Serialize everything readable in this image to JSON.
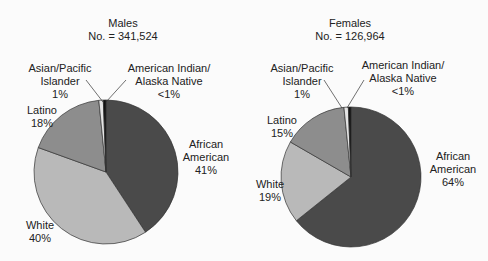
{
  "chart_data": [
    {
      "type": "pie",
      "title": "Males",
      "subtitle": "No. = 341,524",
      "slices": [
        {
          "label": "African American",
          "value": 41,
          "display": "41%",
          "color": "#4a4a4a"
        },
        {
          "label": "White",
          "value": 40,
          "display": "40%",
          "color": "#b9b9b9"
        },
        {
          "label": "Latino",
          "value": 18,
          "display": "18%",
          "color": "#8d8d8d"
        },
        {
          "label": "Asian/Pacific Islander",
          "value": 1,
          "display": "1%",
          "color": "#e4e4e4"
        },
        {
          "label": "American Indian/Alaska Native",
          "value": 0.6,
          "display": "<1%",
          "color": "#111111"
        }
      ]
    },
    {
      "type": "pie",
      "title": "Females",
      "subtitle": "No. = 126,964",
      "slices": [
        {
          "label": "African American",
          "value": 64,
          "display": "64%",
          "color": "#4a4a4a"
        },
        {
          "label": "White",
          "value": 19,
          "display": "19%",
          "color": "#b9b9b9"
        },
        {
          "label": "Latino",
          "value": 15,
          "display": "15%",
          "color": "#8d8d8d"
        },
        {
          "label": "Asian/Pacific Islander",
          "value": 1,
          "display": "1%",
          "color": "#e4e4e4"
        },
        {
          "label": "American Indian/Alaska Native",
          "value": 0.6,
          "display": "<1%",
          "color": "#111111"
        }
      ]
    }
  ],
  "males": {
    "title": "Males",
    "count": "No. = 341,524",
    "asian_l1": "Asian/Pacific",
    "asian_l2": "Islander",
    "asian_pct": "1%",
    "amind_l1": "American Indian/",
    "amind_l2": "Alaska Native",
    "amind_pct": "<1%",
    "latino": "Latino",
    "latino_pct": "18%",
    "white": "White",
    "white_pct": "40%",
    "afam_l1": "African",
    "afam_l2": "American",
    "afam_pct": "41%"
  },
  "females": {
    "title": "Females",
    "count": "No. = 126,964",
    "asian_l1": "Asian/Pacific",
    "asian_l2": "Islander",
    "asian_pct": "1%",
    "amind_l1": "American Indian/",
    "amind_l2": "Alaska Native",
    "amind_pct": "<1%",
    "latino": "Latino",
    "latino_pct": "15%",
    "white": "White",
    "white_pct": "19%",
    "afam_l1": "African",
    "afam_l2": "American",
    "afam_pct": "64%"
  }
}
